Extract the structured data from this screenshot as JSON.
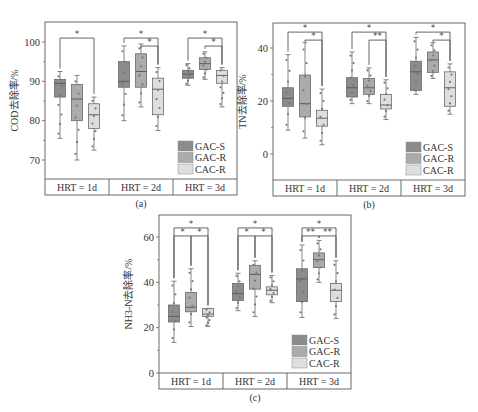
{
  "colors": {
    "GAC-S": "#8c8c8c",
    "GAC-R": "#ababab",
    "CAC-R": "#dedede",
    "frame": "#5a5a5a"
  },
  "chart_data": [
    {
      "id": "a",
      "type": "box",
      "caption": "(a)",
      "ylabel": "COD去除率/%",
      "yticks": [
        70,
        80,
        90,
        100
      ],
      "ylim": [
        65,
        104
      ],
      "categories": [
        "HRT = 1d",
        "HRT = 2d",
        "HRT = 3d"
      ],
      "legend": [
        "GAC-S",
        "GAC-R",
        "CAC-R"
      ],
      "layout": {
        "x0": 45,
        "x1": 237,
        "y0": 22,
        "yb": 179,
        "y2": 195,
        "tickTop": 100,
        "tickTopY": 42,
        "tickBot": 70,
        "tickBotY": 160
      },
      "series": [
        {
          "name": "GAC-S",
          "boxes": [
            {
              "min": 75.5,
              "q1": 86,
              "median": 89.5,
              "q3": 90.5,
              "max": 92.5
            },
            {
              "min": 80,
              "q1": 88.5,
              "median": 90,
              "q3": 95,
              "max": 99
            },
            {
              "min": 89,
              "q1": 90.8,
              "median": 91.8,
              "q3": 92.8,
              "max": 94.5
            }
          ]
        },
        {
          "name": "GAC-R",
          "boxes": [
            {
              "min": 70,
              "q1": 80,
              "median": 85.5,
              "q3": 89.2,
              "max": 91.5
            },
            {
              "min": 83.5,
              "q1": 88.5,
              "median": 92.5,
              "q3": 97,
              "max": 99.5
            },
            {
              "min": 90.5,
              "q1": 93,
              "median": 94.5,
              "q3": 96,
              "max": 97.5
            }
          ]
        },
        {
          "name": "CAC-R",
          "boxes": [
            {
              "min": 72.5,
              "q1": 78,
              "median": 81.5,
              "q3": 84.3,
              "max": 86
            },
            {
              "min": 77.5,
              "q1": 81.5,
              "median": 88,
              "q3": 90.8,
              "max": 93.5
            },
            {
              "min": 83.5,
              "q1": 89.5,
              "median": 91.5,
              "q3": 92.8,
              "max": 93.5
            }
          ]
        }
      ],
      "significance": [
        {
          "group": 0,
          "from": 0,
          "to": 2,
          "label": "*",
          "level": 0
        },
        {
          "group": 1,
          "from": 0,
          "to": 2,
          "label": "*",
          "level": 0
        },
        {
          "group": 1,
          "from": 1,
          "to": 2,
          "label": "*",
          "level": 1
        },
        {
          "group": 2,
          "from": 0,
          "to": 2,
          "label": "*",
          "level": 0
        },
        {
          "group": 2,
          "from": 1,
          "to": 2,
          "label": "*",
          "level": 1
        }
      ],
      "sigBase": 101
    },
    {
      "id": "b",
      "type": "box",
      "caption": "(b)",
      "ylabel": "TN去除率/%",
      "yticks": [
        0,
        20,
        40
      ],
      "ylim": [
        -10,
        50
      ],
      "categories": [
        "HRT = 1d",
        "HRT = 2d",
        "HRT = 3d"
      ],
      "legend": [
        "GAC-S",
        "GAC-R",
        "CAC-R"
      ],
      "layout": {
        "x0": 273,
        "x1": 465,
        "y0": 23,
        "yb": 180,
        "y2": 196,
        "tickTop": 40,
        "tickTopY": 48,
        "tickBot": 0,
        "tickBotY": 154
      },
      "series": [
        {
          "name": "GAC-S",
          "boxes": [
            {
              "min": 9,
              "q1": 18,
              "median": 21,
              "q3": 25,
              "max": 37.5
            },
            {
              "min": 19,
              "q1": 21.5,
              "median": 25,
              "q3": 28.8,
              "max": 38.5
            },
            {
              "min": 22.5,
              "q1": 24,
              "median": 31,
              "q3": 35,
              "max": 44
            }
          ]
        },
        {
          "name": "GAC-R",
          "boxes": [
            {
              "min": 6,
              "q1": 14,
              "median": 19,
              "q3": 29.8,
              "max": 42
            },
            {
              "min": 19,
              "q1": 22.5,
              "median": 25,
              "q3": 28.5,
              "max": 32.5
            },
            {
              "min": 28.5,
              "q1": 30.8,
              "median": 35.5,
              "q3": 38.5,
              "max": 42
            }
          ]
        },
        {
          "name": "CAC-R",
          "boxes": [
            {
              "min": 3.5,
              "q1": 10.5,
              "median": 13.5,
              "q3": 16.5,
              "max": 24.5
            },
            {
              "min": 13,
              "q1": 17,
              "median": 18.5,
              "q3": 22.5,
              "max": 28
            },
            {
              "min": 15,
              "q1": 18,
              "median": 25,
              "q3": 31,
              "max": 34
            }
          ]
        }
      ],
      "significance": [
        {
          "group": 0,
          "from": 0,
          "to": 2,
          "label": "*",
          "level": 0
        },
        {
          "group": 0,
          "from": 1,
          "to": 2,
          "label": "*",
          "level": 1
        },
        {
          "group": 1,
          "from": 0,
          "to": 2,
          "label": "*",
          "level": 0
        },
        {
          "group": 1,
          "from": 1,
          "to": 2,
          "label": "**",
          "level": 1
        },
        {
          "group": 2,
          "from": 0,
          "to": 2,
          "label": "*",
          "level": 0
        },
        {
          "group": 2,
          "from": 1,
          "to": 2,
          "label": "*",
          "level": 1
        }
      ],
      "sigBase": 46
    },
    {
      "id": "c",
      "type": "box",
      "caption": "(c)",
      "ylabel": "NH3-N去除率/%",
      "yticks": [
        0,
        20,
        40,
        60
      ],
      "ylim": [
        0,
        70
      ],
      "categories": [
        "HRT = 1d",
        "HRT = 2d",
        "HRT = 3d"
      ],
      "legend": [
        "GAC-S",
        "GAC-R",
        "CAC-R"
      ],
      "layout": {
        "x0": 159,
        "x1": 351,
        "y0": 215,
        "yb": 373,
        "y2": 389,
        "tickTop": 60,
        "tickTopY": 237,
        "tickBot": 0,
        "tickBotY": 373
      },
      "series": [
        {
          "name": "GAC-S",
          "boxes": [
            {
              "min": 13.5,
              "q1": 22.5,
              "median": 25,
              "q3": 30,
              "max": 40.5
            },
            {
              "min": 27.5,
              "q1": 32,
              "median": 35,
              "q3": 39.5,
              "max": 44
            },
            {
              "min": 24.5,
              "q1": 31.5,
              "median": 41.5,
              "q3": 46,
              "max": 56.5
            }
          ]
        },
        {
          "name": "GAC-R",
          "boxes": [
            {
              "min": 20.5,
              "q1": 27,
              "median": 29,
              "q3": 35.5,
              "max": 46
            },
            {
              "min": 25,
              "q1": 37,
              "median": 43.5,
              "q3": 47.5,
              "max": 49.5
            },
            {
              "min": 40,
              "q1": 46.5,
              "median": 50,
              "q3": 53,
              "max": 58.5
            }
          ]
        },
        {
          "name": "CAC-R",
          "boxes": [
            {
              "min": 20.5,
              "q1": 25,
              "median": 26,
              "q3": 28.5,
              "max": 28.5
            },
            {
              "min": 31,
              "q1": 34.5,
              "median": 36.5,
              "q3": 38,
              "max": 43
            },
            {
              "min": 24,
              "q1": 31.5,
              "median": 36.5,
              "q3": 39.5,
              "max": 49.5
            }
          ]
        }
      ],
      "significance": [
        {
          "group": 0,
          "from": 0,
          "to": 2,
          "label": "*",
          "level": 0
        },
        {
          "group": 0,
          "from": 0,
          "to": 1,
          "label": "*",
          "level": 1
        },
        {
          "group": 0,
          "from": 1,
          "to": 2,
          "label": "*",
          "level": 1
        },
        {
          "group": 1,
          "from": 0,
          "to": 2,
          "label": "*",
          "level": 0
        },
        {
          "group": 1,
          "from": 0,
          "to": 1,
          "label": "*",
          "level": 1
        },
        {
          "group": 1,
          "from": 1,
          "to": 2,
          "label": "*",
          "level": 1
        },
        {
          "group": 2,
          "from": 0,
          "to": 2,
          "label": "*",
          "level": 0
        },
        {
          "group": 2,
          "from": 0,
          "to": 1,
          "label": "**",
          "level": 1
        },
        {
          "group": 2,
          "from": 1,
          "to": 2,
          "label": "**",
          "level": 1
        }
      ],
      "sigBase": 64
    }
  ]
}
